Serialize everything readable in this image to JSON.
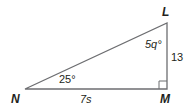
{
  "diagram": {
    "type": "right-triangle",
    "vertices": {
      "N": "N",
      "M": "M",
      "L": "L"
    },
    "right_angle_at": "M",
    "angles": {
      "N": "25°",
      "L": "5q°"
    },
    "sides": {
      "NM": "7s",
      "LM": "13"
    },
    "colors": {
      "stroke": "#6d6e71",
      "text": "#231f20"
    }
  }
}
